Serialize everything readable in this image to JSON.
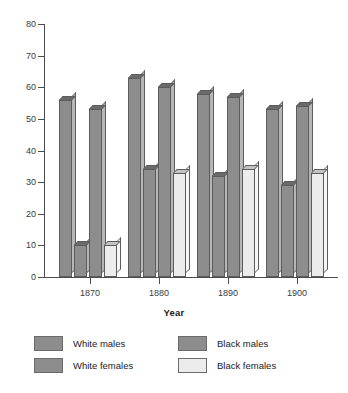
{
  "chart_data": {
    "type": "bar",
    "title": "",
    "subtitle": "",
    "xlabel": "Year",
    "ylabel": "",
    "categories": [
      "1870",
      "1880",
      "1890",
      "1900"
    ],
    "series": [
      {
        "name": "White males",
        "values": [
          56,
          63,
          58,
          53
        ],
        "color": "#8d8d8d"
      },
      {
        "name": "Black males",
        "values": [
          10,
          34,
          32,
          29
        ],
        "color": "#8d8d8d"
      },
      {
        "name": "White females",
        "values": [
          53,
          60,
          57,
          54
        ],
        "color": "#8d8d8d"
      },
      {
        "name": "Black females",
        "values": [
          10,
          33,
          34,
          33
        ],
        "color": "#ececec"
      }
    ],
    "ylim": [
      0,
      80
    ],
    "yticks": [
      0,
      10,
      20,
      30,
      40,
      50,
      60,
      70,
      80
    ],
    "grid": false,
    "legend_position": "bottom",
    "style": "3d-column"
  },
  "axis": {
    "y_tick_labels": [
      "80",
      "70",
      "60",
      "50",
      "40",
      "30",
      "20",
      "10",
      "0"
    ],
    "x_tick_labels": [
      "1870",
      "1880",
      "1890",
      "1900"
    ],
    "x_title": "Year"
  },
  "legend": {
    "entries": [
      {
        "label": "White males",
        "swatch": "dark"
      },
      {
        "label": "White females",
        "swatch": "dark"
      },
      {
        "label": "Black males",
        "swatch": "dark"
      },
      {
        "label": "Black females",
        "swatch": "light"
      }
    ]
  },
  "colors": {
    "bar_dark": "#8d8d8d",
    "bar_light": "#ececec",
    "bar_outline": "#5c5c5c",
    "axis": "#4d4d4d",
    "text": "#1a1a1a",
    "background": "#ffffff"
  }
}
